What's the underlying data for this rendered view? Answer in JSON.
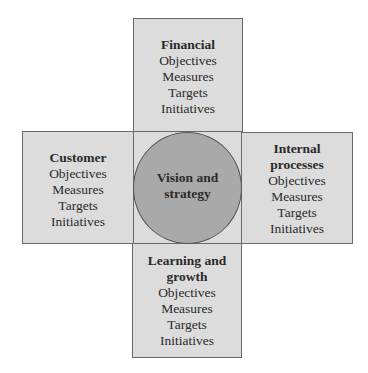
{
  "diagram": {
    "type": "balanced-scorecard",
    "center": {
      "title_line1": "Vision and",
      "title_line2": "strategy"
    },
    "perspectives": {
      "top": {
        "title_lines": [
          "Financial"
        ],
        "items": [
          "Objectives",
          "Measures",
          "Targets",
          "Initiatives"
        ]
      },
      "left": {
        "title_lines": [
          "Customer"
        ],
        "items": [
          "Objectives",
          "Measures",
          "Targets",
          "Initiatives"
        ]
      },
      "right": {
        "title_lines": [
          "Internal",
          "processes"
        ],
        "items": [
          "Objectives",
          "Measures",
          "Targets",
          "Initiatives"
        ]
      },
      "bottom": {
        "title_lines": [
          "Learning and",
          "growth"
        ],
        "items": [
          "Objectives",
          "Measures",
          "Targets",
          "Initiatives"
        ]
      }
    },
    "colors": {
      "box_fill": "#dcdcdc",
      "circle_fill": "#a9a9a9",
      "stroke": "#6a6a6a"
    }
  }
}
